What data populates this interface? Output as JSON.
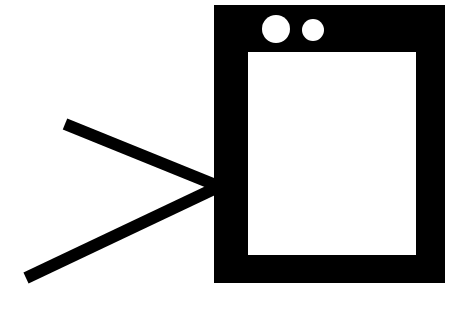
{
  "diagram": {
    "colors": {
      "background": "#ffffff",
      "stroke": "#000000",
      "dots": "#ffffff"
    },
    "frame": {
      "x": 214,
      "y": 5,
      "width": 231,
      "height": 278
    },
    "screen": {
      "x": 248,
      "y": 52,
      "width": 168,
      "height": 203
    },
    "dots": [
      {
        "cx": 276,
        "cy": 29,
        "r": 14
      },
      {
        "cx": 313,
        "cy": 30,
        "r": 11
      }
    ],
    "lines": [
      {
        "x1": 65,
        "y1": 124,
        "x2": 218,
        "y2": 186,
        "width": 12
      },
      {
        "x1": 26,
        "y1": 278,
        "x2": 218,
        "y2": 187,
        "width": 12
      }
    ]
  }
}
